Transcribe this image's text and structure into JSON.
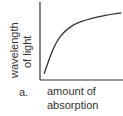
{
  "chart_data": {
    "type": "line",
    "title": "",
    "panel_label": "a.",
    "xlabel": "amount of absorption",
    "ylabel": "wavelength of light",
    "xlabel_lines": [
      "amount of",
      "absorption"
    ],
    "ylabel_lines": [
      "wavelength",
      "of light"
    ],
    "grid": false,
    "ticks": false,
    "xlim": [
      0,
      1
    ],
    "ylim": [
      0,
      1
    ],
    "series": [
      {
        "name": "curve",
        "x": [
          0.05,
          0.12,
          0.2,
          0.3,
          0.42,
          0.55,
          0.7,
          0.85,
          0.98
        ],
        "y": [
          0.08,
          0.3,
          0.5,
          0.63,
          0.72,
          0.77,
          0.81,
          0.84,
          0.86
        ]
      }
    ],
    "color": "#333333"
  }
}
